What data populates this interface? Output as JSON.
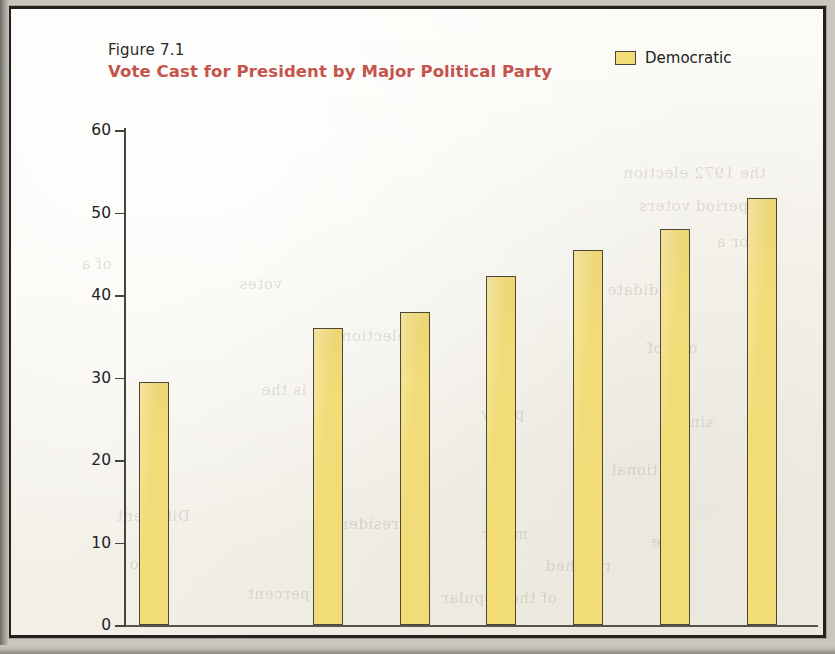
{
  "figure": {
    "number": "Figure 7.1",
    "title": "Vote Cast for President by Major Political Party"
  },
  "legend": {
    "items": [
      {
        "label": "Democratic",
        "color": "#f2dc78"
      }
    ]
  },
  "colors": {
    "title_red": "#c4544c",
    "bar_yellow": "#f2dc78",
    "bar_outline": "#4e4734",
    "axis": "#46443e",
    "paper": "#fbfaf6",
    "frame": "#23211e"
  },
  "ghost_text": [
    {
      "text": "the 1972 election",
      "x": 612,
      "y": 155
    },
    {
      "text": "period voters",
      "x": 628,
      "y": 188
    },
    {
      "text": "for a",
      "x": 705,
      "y": 224
    },
    {
      "text": "of a",
      "x": 70,
      "y": 246
    },
    {
      "text": "votes",
      "x": 228,
      "y": 266
    },
    {
      "text": "candidate",
      "x": 596,
      "y": 272
    },
    {
      "text": "election",
      "x": 330,
      "y": 318
    },
    {
      "text": "one of",
      "x": 636,
      "y": 330
    },
    {
      "text": "is the",
      "x": 250,
      "y": 372
    },
    {
      "text": "party",
      "x": 470,
      "y": 396
    },
    {
      "text": "since",
      "x": 660,
      "y": 404
    },
    {
      "text": "the",
      "x": 300,
      "y": 438
    },
    {
      "text": "national",
      "x": 600,
      "y": 452
    },
    {
      "text": "Different",
      "x": 105,
      "y": 498
    },
    {
      "text": "Presidential",
      "x": 300,
      "y": 506
    },
    {
      "text": "major",
      "x": 470,
      "y": 516
    },
    {
      "text": "the",
      "x": 640,
      "y": 524
    },
    {
      "text": "two",
      "x": 118,
      "y": 546
    },
    {
      "text": "reached",
      "x": 534,
      "y": 548
    },
    {
      "text": "percent",
      "x": 236,
      "y": 576
    },
    {
      "text": "of the popular",
      "x": 430,
      "y": 580
    }
  ],
  "chart_data": {
    "type": "bar",
    "title": "Vote Cast for President by Major Political Party",
    "xlabel": "",
    "ylabel": "",
    "categories": [
      "1972",
      "1976",
      "1980",
      "1984",
      "1988",
      "1992",
      "1996",
      "2000"
    ],
    "series": [
      {
        "name": "Democratic",
        "color": "#f2dc78",
        "values": [
          29.4,
          null,
          36.0,
          38.0,
          42.3,
          45.5,
          48.0,
          51.8
        ]
      }
    ],
    "ylim": [
      0,
      60
    ],
    "yticks": [
      0,
      10,
      20,
      30,
      40,
      50,
      60
    ],
    "grid": false,
    "legend_position": "top-right"
  }
}
